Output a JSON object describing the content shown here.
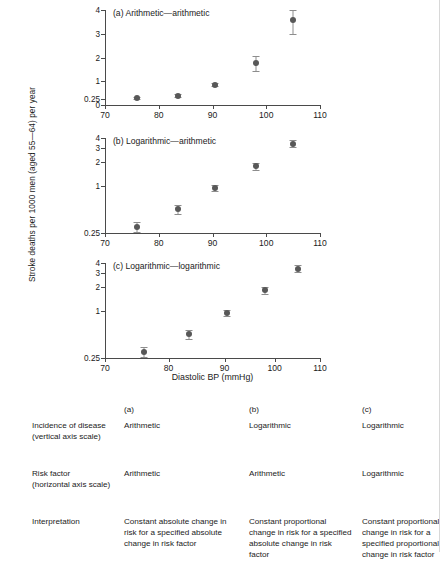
{
  "figure": {
    "ylabel": "Stroke deaths per 1000 men (aged 55—64) per year",
    "xlabel": "Diastolic BP (mmHg)",
    "panels": [
      {
        "title": "(a) Arithmetic—arithmetic"
      },
      {
        "title": "(b) Logarithmic—arithmetic"
      },
      {
        "title": "(c) Logarithmic—logarithmic"
      }
    ]
  },
  "chart_data": [
    {
      "type": "scatter",
      "title": "(a) Arithmetic—arithmetic",
      "xlabel": "Diastolic BP (mmHg)",
      "ylabel": "Stroke deaths per 1000 men (aged 55—64) per year",
      "xscale": "linear",
      "yscale": "linear",
      "xlim": [
        70,
        110
      ],
      "ylim": [
        0,
        4
      ],
      "xticks": [
        70,
        80,
        90,
        100,
        110
      ],
      "yticks": [
        0,
        0.25,
        1,
        2,
        3,
        4
      ],
      "ytick_labels": [
        "0",
        "0.25",
        "1",
        "2",
        "3",
        "4"
      ],
      "grid": false,
      "legend": "none",
      "x": [
        76,
        83.5,
        90.5,
        98,
        105
      ],
      "y": [
        0.28,
        0.4,
        0.85,
        1.75,
        3.6
      ],
      "yerr_low": [
        0.04,
        0.05,
        0.07,
        0.3,
        0.62
      ],
      "yerr_high": [
        0.04,
        0.05,
        0.07,
        0.3,
        0.4
      ]
    },
    {
      "type": "scatter",
      "title": "(b) Logarithmic—arithmetic",
      "xlabel": "Diastolic BP (mmHg)",
      "ylabel": "Stroke deaths per 1000 men (aged 55—64) per year",
      "xscale": "linear",
      "yscale": "log",
      "xlim": [
        70,
        110
      ],
      "ylim": [
        0.25,
        4
      ],
      "xticks": [
        70,
        80,
        90,
        100,
        110
      ],
      "yticks": [
        0.25,
        1,
        2,
        3,
        4
      ],
      "ytick_labels": [
        "0.25",
        "1",
        "2",
        "3",
        "4"
      ],
      "grid": false,
      "legend": "none",
      "x": [
        76,
        83.5,
        90.5,
        98,
        105
      ],
      "y": [
        0.3,
        0.5,
        0.93,
        1.75,
        3.4
      ],
      "yerr_low": [
        0.04,
        0.06,
        0.08,
        0.18,
        0.35
      ],
      "yerr_high": [
        0.04,
        0.06,
        0.08,
        0.18,
        0.35
      ]
    },
    {
      "type": "scatter",
      "title": "(c) Logarithmic—logarithmic",
      "xlabel": "Diastolic BP (mmHg)",
      "ylabel": "Stroke deaths per 1000 men (aged 55—64) per year",
      "xscale": "log",
      "yscale": "log",
      "xlim": [
        70,
        110
      ],
      "ylim": [
        0.25,
        4
      ],
      "xticks": [
        70,
        80,
        90,
        100,
        110
      ],
      "yticks": [
        0.25,
        1,
        2,
        3,
        4
      ],
      "ytick_labels": [
        "0.25",
        "1",
        "2",
        "3",
        "4"
      ],
      "grid": false,
      "legend": "none",
      "x": [
        76,
        83.5,
        90.5,
        98,
        105
      ],
      "y": [
        0.3,
        0.5,
        0.93,
        1.8,
        3.4
      ],
      "yerr_low": [
        0.04,
        0.06,
        0.09,
        0.2,
        0.35
      ],
      "yerr_high": [
        0.04,
        0.06,
        0.09,
        0.2,
        0.35
      ]
    }
  ],
  "table": {
    "header": [
      "",
      "(a)",
      "(b)",
      "(c)"
    ],
    "rows": [
      {
        "label_line1": "Incidence of disease",
        "label_line2": "(vertical axis scale)",
        "a": "Arithmetic",
        "b": "Logarithmic",
        "c": "Logarithmic"
      },
      {
        "label_line1": "Risk factor",
        "label_line2": "(horizontal axis scale)",
        "a": "Arithmetic",
        "b": "Arithmetic",
        "c": "Logarithmic"
      },
      {
        "label_line1": "Interpretation",
        "label_line2": "",
        "a": "Constant absolute change in risk for a specified absolute change in risk factor",
        "b": "Constant proportional change in risk for a specified absolute change in risk factor",
        "c": "Constant proportional change in risk for a specified proportional change in risk factor"
      }
    ]
  }
}
